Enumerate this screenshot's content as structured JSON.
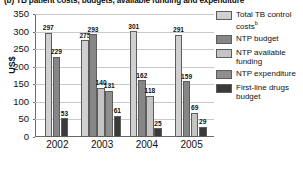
{
  "chart_data": {
    "type": "bar",
    "title": "(b) TB patient costs, budgets, available funding and expenditure",
    "xlabel": "",
    "ylabel": "US$",
    "categories": [
      "2002",
      "2003",
      "2004",
      "2005"
    ],
    "ylim": [
      0,
      350
    ],
    "yticks": [
      0,
      50,
      100,
      150,
      200,
      250,
      300,
      350
    ],
    "ytick_labels": [
      "0",
      "50",
      "100",
      "150",
      "200",
      "250",
      "300",
      "350"
    ],
    "grid": true,
    "legend_position": "right",
    "series": [
      {
        "name": "Total TB control costs",
        "name_superscript": "b",
        "color": "#d0d0d0",
        "values": [
          297,
          275,
          301,
          291
        ],
        "labels": [
          "297",
          "275",
          "301",
          "291"
        ]
      },
      {
        "name": "NTP budget",
        "color": "#868686",
        "values": [
          229,
          293,
          162,
          159
        ],
        "labels": [
          "229",
          "293",
          "162",
          "159"
        ]
      },
      {
        "name": "NTP available funding",
        "color": "#c4c4c4",
        "values": [
          null,
          140,
          118,
          69
        ],
        "labels": [
          "",
          "140",
          "118",
          "69"
        ]
      },
      {
        "name": "NTP expenditure",
        "color": "#8f8f8f",
        "values": [
          null,
          131,
          null,
          null
        ],
        "labels": [
          "",
          "131",
          "",
          ""
        ]
      },
      {
        "name": "First-line drugs budget",
        "color": "#3a3a3a",
        "values": [
          53,
          61,
          25,
          29
        ],
        "labels": [
          "53",
          "61",
          "25",
          "29"
        ]
      }
    ]
  },
  "legend": {
    "items": [
      {
        "label": "Total TB control costs",
        "sup": "b",
        "color": "#d0d0d0"
      },
      {
        "label": "NTP budget",
        "sup": "",
        "color": "#868686"
      },
      {
        "label": "NTP available funding",
        "sup": "",
        "color": "#c4c4c4"
      },
      {
        "label": "NTP expenditure",
        "sup": "",
        "color": "#8f8f8f"
      },
      {
        "label": "First-line drugs budget",
        "sup": "",
        "color": "#3a3a3a"
      }
    ]
  }
}
